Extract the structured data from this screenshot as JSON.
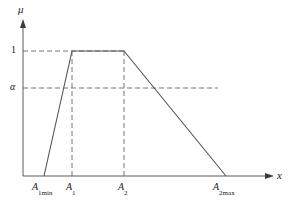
{
  "figure": {
    "name": "trapezoidal-membership-function",
    "background_color": "#ffffff",
    "line_color": "#555555",
    "dash_color": "#666666",
    "text_color": "#1a1a1a"
  },
  "axes": {
    "y_axis_label": "μ",
    "x_axis_label": "x",
    "y_ticks": [
      {
        "label": "1",
        "value": 1
      },
      {
        "label": "α",
        "value": 0.7
      }
    ],
    "x_ticks": [
      {
        "label_main": "A",
        "label_sub": "1min"
      },
      {
        "label_main": "A",
        "label_sub": "1"
      },
      {
        "label_main": "A",
        "label_sub": "2"
      },
      {
        "label_main": "A",
        "label_sub": "2max"
      }
    ]
  },
  "chart_data": {
    "type": "line",
    "title": "",
    "xlabel": "x",
    "ylabel": "μ",
    "xlim": [
      0,
      290
    ],
    "ylim": [
      0,
      1.18
    ],
    "grid": false,
    "legend": null,
    "categories": [
      "A1min",
      "A1",
      "A2",
      "A2max"
    ],
    "series": [
      {
        "name": "membership",
        "points": [
          {
            "x_label": "A1min",
            "x": 44,
            "y": 0
          },
          {
            "x_label": "A1",
            "x": 72,
            "y": 1
          },
          {
            "x_label": "A2",
            "x": 124,
            "y": 1
          },
          {
            "x_label": "A2max",
            "x": 226,
            "y": 0
          }
        ]
      }
    ],
    "annotations": [
      {
        "name": "level-one-guide",
        "type": "dashed-horizontal",
        "y": 1,
        "label": "1",
        "from_x": 23,
        "to_x": 124
      },
      {
        "name": "level-alpha-guide",
        "type": "dashed-horizontal",
        "y": 0.7,
        "label": "α",
        "from_x": 23,
        "to_x": 218
      },
      {
        "name": "a1-guide",
        "type": "dashed-vertical",
        "x": 72,
        "from_y": 0,
        "to_y": 1
      },
      {
        "name": "a2-guide",
        "type": "dashed-vertical",
        "x": 124,
        "from_y": 0,
        "to_y": 1
      }
    ]
  },
  "geometry": {
    "y_axis_x": 23,
    "baseline_y": 176,
    "top_y": 22,
    "right_x": 272,
    "level_one_y": 51,
    "level_alpha_y": 88,
    "tick_x_a1min": 44,
    "tick_x_a1": 72,
    "tick_x_a2": 124,
    "tick_x_a2max": 226,
    "label_y_bottom": 185
  }
}
